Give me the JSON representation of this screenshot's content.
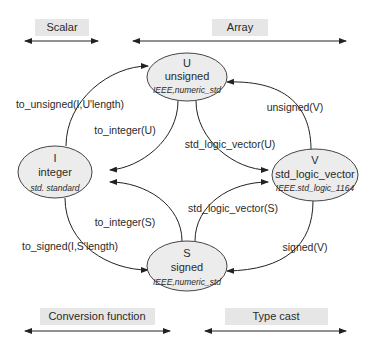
{
  "categories": {
    "scalar": "Scalar",
    "array": "Array",
    "conversion_function": "Conversion function",
    "type_cast": "Type cast"
  },
  "nodes": {
    "U": {
      "symbol": "U",
      "type": "unsigned",
      "library": "IEEE,numeric_std"
    },
    "I": {
      "symbol": "I",
      "type": "integer",
      "library": "std. standard"
    },
    "V": {
      "symbol": "V",
      "type": "std_logic_vector",
      "library": "IEEE.std_logic_1164"
    },
    "S": {
      "symbol": "S",
      "type": "signed",
      "library": "IEEE,numeric_std"
    }
  },
  "edges": {
    "i_to_u": "to_unsigned(I,U'length)",
    "u_to_i": "to_integer(U)",
    "u_to_v": "std_logic_vector(U)",
    "v_to_u": "unsigned(V)",
    "s_to_i": "to_integer(S)",
    "s_to_v": "std_logic_vector(S)",
    "i_to_s": "to_signed(I,S'length)",
    "v_to_s": "signed(V)"
  },
  "colors": {
    "node_fill": "#ececec",
    "node_stroke": "#444444",
    "category_box": "#e6e6e6",
    "line": "#222222"
  }
}
